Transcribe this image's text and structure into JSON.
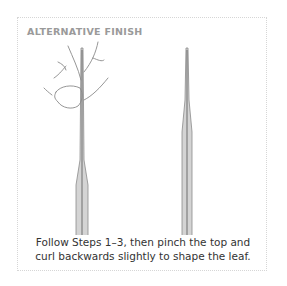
{
  "panel": {
    "title": "ALTERNATIVE FINISH",
    "caption_line1": "Follow Steps 1–3, then pinch the top and",
    "caption_line2": "curl backwards slightly to shape the leaf.",
    "illustrations": [
      {
        "name": "hand-pinching-stem-illustration"
      },
      {
        "name": "finished-stem-illustration"
      }
    ],
    "colors": {
      "border": "#d6d6d6",
      "title": "#9a9a9a",
      "text": "#333333",
      "stem_fill": "#cfcfcf",
      "stem_line": "#7a7a7a"
    }
  }
}
